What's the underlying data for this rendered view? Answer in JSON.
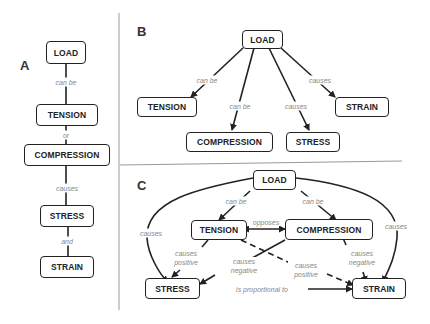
{
  "panels": {
    "A": {
      "letter": "A",
      "nodes": [
        "LOAD",
        "TENSION",
        "COMPRESSION",
        "STRESS",
        "STRAIN"
      ],
      "links": [
        "can be",
        "or",
        "causes",
        "and"
      ]
    },
    "B": {
      "letter": "B",
      "nodes": {
        "load": "LOAD",
        "tension": "TENSION",
        "compression": "COMPRESSION",
        "stress": "STRESS",
        "strain": "STRAIN"
      },
      "links": {
        "load_tension": "can be",
        "load_compression": "can be",
        "load_stress": "causes",
        "load_strain": "causes"
      }
    },
    "C": {
      "letter": "C",
      "nodes": {
        "load": "LOAD",
        "tension": "TENSION",
        "compression": "COMPRESSION",
        "stress": "STRESS",
        "strain": "STRAIN"
      },
      "links": {
        "load_tension": "can be",
        "load_compression": "can be",
        "load_stress": "causes",
        "load_strain": "causes",
        "tension_compression": "opposes",
        "tension_stress": "causes positive",
        "compression_stress": "causes negative",
        "tension_strain": "causes positive",
        "compression_strain": "causes negative",
        "stress_strain": "is proportional to"
      }
    }
  },
  "colors": {
    "stroke": "#222222",
    "label": "#888888",
    "divider": "#999999"
  }
}
